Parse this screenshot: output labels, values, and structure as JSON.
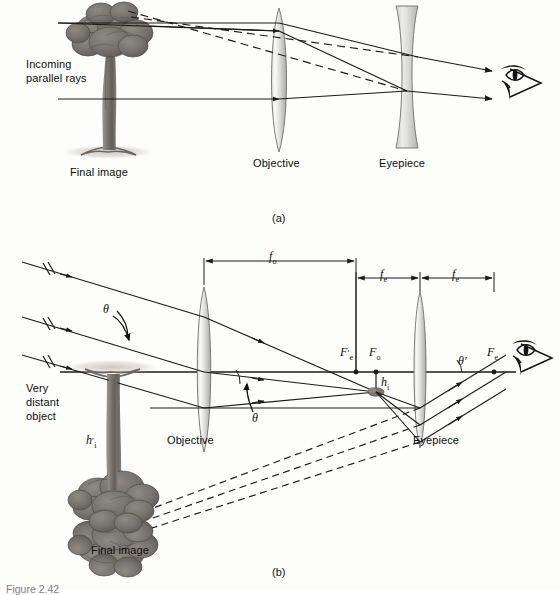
{
  "figure": {
    "caption_partial": "Figure 2.42",
    "panel_a_tag": "(a)",
    "panel_b_tag": "(b)"
  },
  "panel_a": {
    "labels": {
      "incoming_rays_line1": "Incoming",
      "incoming_rays_line2": "parallel rays",
      "final_image": "Final image",
      "objective": "Objective",
      "eyepiece": "Eyepiece"
    },
    "optics": {
      "objective_type": "converging",
      "eyepiece_type": "diverging",
      "telescope_type": "Galilean",
      "image_orientation": "upright"
    }
  },
  "panel_b": {
    "labels": {
      "very_distant_line1": "Very",
      "very_distant_line2": "distant",
      "very_distant_line3": "object",
      "final_image": "Final image",
      "objective": "Objective",
      "eyepiece": "Eyepiece"
    },
    "dimensions": {
      "f_o": "f",
      "f_o_sub": "o",
      "f_e_left": "f",
      "f_e_left_sub": "e",
      "f_e_right": "f",
      "f_e_right_sub": "e"
    },
    "points": {
      "F_e_prime": "F",
      "F_e_prime_sub": "e",
      "F_e_prime_prime": "′",
      "F_o": "F",
      "F_o_sub": "o",
      "F_e": "F",
      "F_e_sub": "e"
    },
    "angles": {
      "theta_object": "θ",
      "theta_objective": "θ",
      "theta_prime": "θ′"
    },
    "heights": {
      "h_i": "h",
      "h_i_sub": "i",
      "h_i_prime": "h",
      "h_i_prime_sub": "i",
      "h_i_prime_mark": "′"
    },
    "optics": {
      "objective_type": "converging",
      "eyepiece_type": "converging",
      "telescope_type": "Keplerian",
      "image_orientation": "inverted"
    }
  },
  "colors": {
    "ink": "#1a1a1a",
    "lens_fill_light": "#f2f2f0",
    "lens_fill_mid": "#c9c9c5",
    "lens_fill_dark": "#a8a8a4",
    "tree_dark": "#6e6a66",
    "tree_mid": "#8a8682",
    "ground_shadow": "#cfcdc9",
    "caption_gray": "#7d7d7d",
    "background": "#fdfdfc"
  }
}
